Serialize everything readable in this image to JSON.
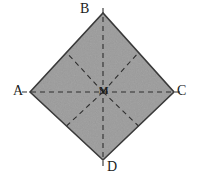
{
  "figure": {
    "type": "geometry-diagram",
    "shape": "square-rotated-45-diamond",
    "canvas": {
      "width": 198,
      "height": 182,
      "background_color": "#ffffff"
    },
    "fill_color": "#9c9c9c",
    "outline_color": "#3a3a3a",
    "dash_color": "#2e2e2e",
    "outline_width": 1.6,
    "dash_width": 1.1,
    "dash_pattern": "5,4",
    "vertices": [
      {
        "id": "A",
        "label": "A",
        "x": 30,
        "y": 92,
        "position": "left"
      },
      {
        "id": "B",
        "label": "B",
        "x": 103,
        "y": 13,
        "position": "top"
      },
      {
        "id": "C",
        "label": "C",
        "x": 174,
        "y": 92,
        "position": "right"
      },
      {
        "id": "D",
        "label": "D",
        "x": 103,
        "y": 160,
        "position": "bottom"
      }
    ],
    "center": {
      "id": "M",
      "label": "M",
      "x": 103,
      "y": 92
    },
    "edge_midpoints": [
      {
        "id": "AB",
        "x": 66.5,
        "y": 52.5
      },
      {
        "id": "BC",
        "x": 138.5,
        "y": 52.5
      },
      {
        "id": "CD",
        "x": 138.5,
        "y": 126
      },
      {
        "id": "DA",
        "x": 66.5,
        "y": 126
      }
    ],
    "dashed_segments": [
      {
        "name": "diagonal-A-C",
        "from": "A",
        "to": "C"
      },
      {
        "name": "diagonal-B-D",
        "from": "B",
        "to": "D"
      },
      {
        "name": "median-M-AB",
        "from": "M",
        "to": "AB"
      },
      {
        "name": "median-M-BC",
        "from": "M",
        "to": "BC"
      },
      {
        "name": "median-M-CD",
        "from": "M",
        "to": "CD"
      },
      {
        "name": "median-M-DA",
        "from": "M",
        "to": "DA"
      }
    ],
    "labels": {
      "A": "A",
      "B": "B",
      "C": "C",
      "D": "D",
      "M": "M"
    }
  }
}
